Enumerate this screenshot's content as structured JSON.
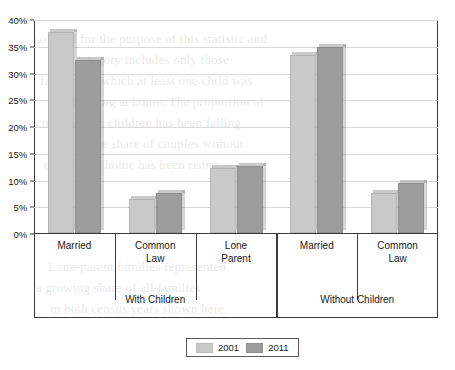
{
  "chart_data": {
    "type": "bar",
    "title": "",
    "subtitle": "",
    "xlabel": "",
    "ylabel": "",
    "ylim": [
      0,
      40
    ],
    "y_tick_labels": [
      "0%",
      "5%",
      "10%",
      "15%",
      "20%",
      "25%",
      "30%",
      "35%",
      "40%"
    ],
    "y_tick_values": [
      0,
      5,
      10,
      15,
      20,
      25,
      30,
      35,
      40
    ],
    "grid": true,
    "legend_position": "bottom-center",
    "categories": [
      "Married",
      "Common Law",
      "Lone Parent",
      "Married",
      "Common Law"
    ],
    "category_lines": [
      [
        "Married"
      ],
      [
        "Common",
        "Law"
      ],
      [
        "Lone",
        "Parent"
      ],
      [
        "Married"
      ],
      [
        "Common",
        "Law"
      ]
    ],
    "groups": [
      {
        "label": "With Children",
        "category_count": 3
      },
      {
        "label": "Without Children",
        "category_count": 2
      }
    ],
    "series": [
      {
        "name": "2001",
        "color": "#c9c9c9",
        "values": [
          37.6,
          6.3,
          12.2,
          33.2,
          7.4
        ]
      },
      {
        "name": "2011",
        "color": "#9d9d9d",
        "values": [
          32.3,
          7.4,
          12.6,
          34.8,
          9.3
        ]
      }
    ]
  },
  "legend": {
    "entries": [
      {
        "label": "2001"
      },
      {
        "label": "2011"
      }
    ]
  },
  "background_text": {
    "lines": [
      "counted for the purpose of this statistic and",
      "this category includes only those",
      "families in which at least one child was",
      "still living at home. The proportion of",
      "couples with children has been falling",
      "while the share of couples without",
      "children at home has been rising.",
      "Lone-parent families represented",
      "a growing share of all families",
      "in both census years shown here."
    ]
  }
}
